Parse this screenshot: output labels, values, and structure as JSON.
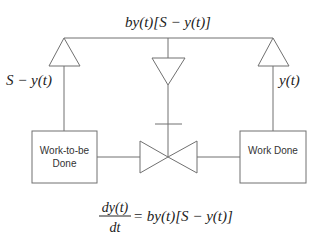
{
  "diagram": {
    "type": "stock-and-flow",
    "top_label": "by(t)[S − y(t)]",
    "left_label": "S − y(t)",
    "right_label": "y(t)",
    "stocks": [
      {
        "id": "work-to-be-done",
        "line1": "Work-to-be",
        "line2": "Done"
      },
      {
        "id": "work-done",
        "line1": "Work Done"
      }
    ],
    "equation": {
      "numerator": "dy(t)",
      "denominator": "dt",
      "rhs": "= by(t)[S − y(t)]"
    },
    "colors": {
      "line": "#707070",
      "text": "#222222",
      "background": "#ffffff"
    }
  }
}
